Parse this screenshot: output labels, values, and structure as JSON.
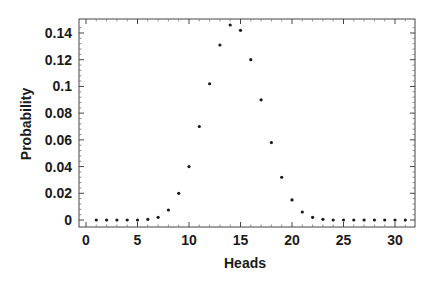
{
  "chart_data": {
    "type": "scatter",
    "title": "",
    "xlabel": "Heads",
    "ylabel": "Probability",
    "xlim": [
      -0.7,
      31.8
    ],
    "ylim": [
      -0.004,
      0.15
    ],
    "x_ticks": [
      0,
      5,
      10,
      15,
      20,
      25,
      30
    ],
    "x_tick_labels": [
      "0",
      "5",
      "10",
      "15",
      "20",
      "25",
      "30"
    ],
    "y_ticks": [
      0,
      0.02,
      0.04,
      0.06,
      0.08,
      0.1,
      0.12,
      0.14
    ],
    "y_tick_labels": [
      "0",
      "0.02",
      "0.04",
      "0.06",
      "0.08",
      "0.1",
      "0.12",
      "0.14"
    ],
    "grid": false,
    "legend": null,
    "frame": true,
    "series": [
      {
        "name": "Probability",
        "marker": "dot",
        "color": "#1a1a1a",
        "x": [
          1,
          2,
          3,
          4,
          5,
          6,
          7,
          8,
          9,
          10,
          11,
          12,
          13,
          14,
          15,
          16,
          17,
          18,
          19,
          20,
          21,
          22,
          23,
          24,
          25,
          26,
          27,
          28,
          29,
          30,
          31
        ],
        "y": [
          0.0,
          0.0,
          0.0,
          0.0,
          0.0,
          0.0005,
          0.002,
          0.0075,
          0.02,
          0.04,
          0.07,
          0.102,
          0.131,
          0.146,
          0.142,
          0.12,
          0.09,
          0.058,
          0.032,
          0.015,
          0.006,
          0.002,
          0.0005,
          0.0,
          0.0,
          0.0,
          0.0,
          0.0,
          0.0,
          0.0,
          0.0
        ]
      }
    ]
  }
}
